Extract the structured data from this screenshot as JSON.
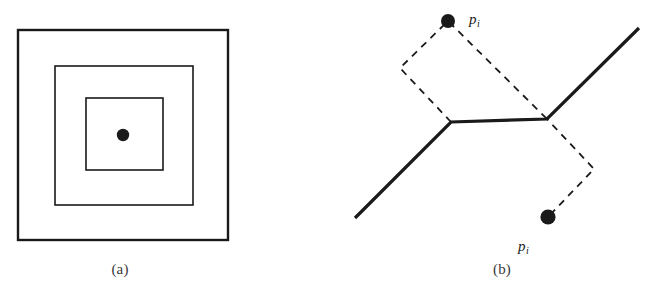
{
  "figure": {
    "background_color": "#ffffff",
    "stroke_color": "#1a1a1a",
    "caption_color": "#3a3a3a",
    "panels": [
      {
        "id": "a",
        "caption": "(a)",
        "description": "nested concentric squares with a center point",
        "squares": [
          {
            "name": "outer-square",
            "x": 18,
            "y": 30,
            "width": 210,
            "height": 210,
            "stroke_width": 2.4
          },
          {
            "name": "middle-square",
            "x": 55,
            "y": 66,
            "width": 138,
            "height": 139,
            "stroke_width": 1.6
          },
          {
            "name": "inner-square",
            "x": 86,
            "y": 98,
            "width": 77,
            "height": 72,
            "stroke_width": 1.6
          }
        ],
        "point": {
          "name": "center-point",
          "cx": 123,
          "cy": 135,
          "r": 6.2
        }
      },
      {
        "id": "b",
        "caption": "(b)",
        "description": "bisector polyline with two dashed parallelograms and two labelled sites",
        "solid_polyline": {
          "name": "bisector-polyline",
          "stroke_width": 3.2,
          "points": "25,218 121,122 217,119 309,28"
        },
        "dashed_parallelogram_top": {
          "name": "dashed-parallelogram-top",
          "stroke_width": 1.8,
          "dash": "7,6",
          "points": "121,122 70,68 118,21 217,119"
        },
        "dashed_parallelogram_bottom": {
          "name": "dashed-parallelogram-bottom",
          "stroke_width": 1.8,
          "dash": "7,6",
          "points": "121,122 217,119 264,169 218,217"
        },
        "points": [
          {
            "name": "site-point-top",
            "cx": 118,
            "cy": 21,
            "r": 7.0,
            "label": "p",
            "subscript": "i"
          },
          {
            "name": "site-point-bottom",
            "cx": 218,
            "cy": 217,
            "r": 7.6,
            "label": "p",
            "subscript": "i"
          }
        ]
      }
    ]
  },
  "labels": {
    "caption_a": "(a)",
    "caption_b": "(b)",
    "point_top_base": "p",
    "point_top_sub": "i",
    "point_bottom_base": "p",
    "point_bottom_sub": "i"
  }
}
